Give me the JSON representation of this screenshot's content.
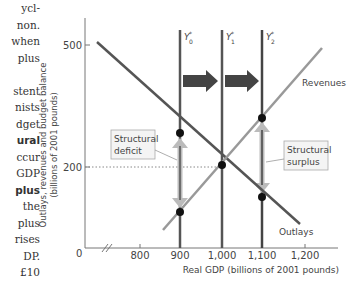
{
  "side_text": {
    "lines": [
      "ycl-",
      "non.",
      "when",
      "plus",
      "",
      "stent",
      "nists",
      "dget",
      "ural",
      "ccur",
      "GDP",
      "plus",
      " the",
      "plus",
      "rises",
      "DP.",
      "£10"
    ],
    "bold_lines": [
      8,
      11
    ]
  },
  "chart_data": {
    "type": "line",
    "title": "",
    "xlabel": "Real GDP (billions of 2001 pounds)",
    "ylabel": "Outlays, revenues and budget balance (billions of 2001 pounds)",
    "x_ticks": [
      "800",
      "900",
      "1,000",
      "1,100",
      "1,200"
    ],
    "y_ticks": [
      "0",
      "200",
      "500"
    ],
    "xlim": [
      680,
      1280
    ],
    "ylim": [
      0,
      580
    ],
    "axis_break": true,
    "grid": false,
    "series": [
      {
        "name": "Outlays",
        "x": [
          715,
          1000,
          1170
        ],
        "y": [
          505,
          200,
          60
        ],
        "color": "#555555"
      },
      {
        "name": "Revenues",
        "x": [
          880,
          1000,
          1250
        ],
        "y": [
          45,
          200,
          490
        ],
        "color": "#999999"
      }
    ],
    "vertical_lines": [
      {
        "label": "Y*",
        "sub": "0",
        "x": 900
      },
      {
        "label": "Y*",
        "sub": "1",
        "x": 1000
      },
      {
        "label": "Y*",
        "sub": "2",
        "x": 1100
      }
    ],
    "points": [
      {
        "x": 900,
        "y": 300
      },
      {
        "x": 900,
        "y": 90
      },
      {
        "x": 1000,
        "y": 200
      },
      {
        "x": 1100,
        "y": 320
      },
      {
        "x": 1100,
        "y": 125
      }
    ],
    "reference_line": {
      "y": 200,
      "style": "dotted"
    },
    "annotations": [
      {
        "text": "Structural deficit",
        "x": 900
      },
      {
        "text": "Structural surplus",
        "x": 1100
      },
      {
        "text": "Revenues"
      },
      {
        "text": "Outlays"
      }
    ],
    "shift_arrows": [
      {
        "from": "Y0*",
        "to": "Y1*"
      },
      {
        "from": "Y1*",
        "to": "Y2*"
      }
    ]
  },
  "labels": {
    "y500": "500",
    "y200": "200",
    "y0": "Y",
    "x800": "800",
    "x900": "900",
    "x1000": "1,000",
    "x1100": "1,100",
    "x1200": "1,200",
    "xlabel": "Real GDP (billions of 2001 pounds)",
    "ylabel1": "Outlays, revenues and budget balance",
    "ylabel2": "(billions of 2001 pounds)",
    "revenues": "Revenues",
    "outlays": "Outlays",
    "deficit1": "Structural",
    "deficit2": "deficit",
    "surplus1": "Structural",
    "surplus2": "surplus",
    "y0_sub": "0",
    "y1_sub": "1",
    "y2_sub": "2",
    "star": "*"
  }
}
